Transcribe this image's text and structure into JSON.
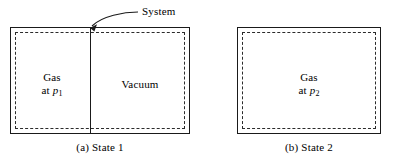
{
  "figure": {
    "type": "thermodynamics-diagram",
    "background_color": "#ffffff",
    "line_color": "#1a1a1a",
    "boundary_style": "dashed"
  },
  "callout": {
    "label": "System",
    "icon": "curved-arrow-icon",
    "points_to": "partition-top",
    "tip_x": 90,
    "tip_y": 28
  },
  "panels": [
    {
      "id": "state-1",
      "caption": "(a) State 1",
      "regions": [
        {
          "id": "gas-region",
          "line1": "Gas",
          "line2_prefix": "at ",
          "line2_var": "p",
          "line2_sub": "1"
        },
        {
          "id": "vacuum-region",
          "line1": "Vacuum",
          "line2_prefix": "",
          "line2_var": "",
          "line2_sub": ""
        }
      ],
      "has_partition": true
    },
    {
      "id": "state-2",
      "caption": "(b) State 2",
      "regions": [
        {
          "id": "gas-region",
          "line1": "Gas",
          "line2_prefix": "at ",
          "line2_var": "p",
          "line2_sub": "2"
        }
      ],
      "has_partition": false
    }
  ]
}
